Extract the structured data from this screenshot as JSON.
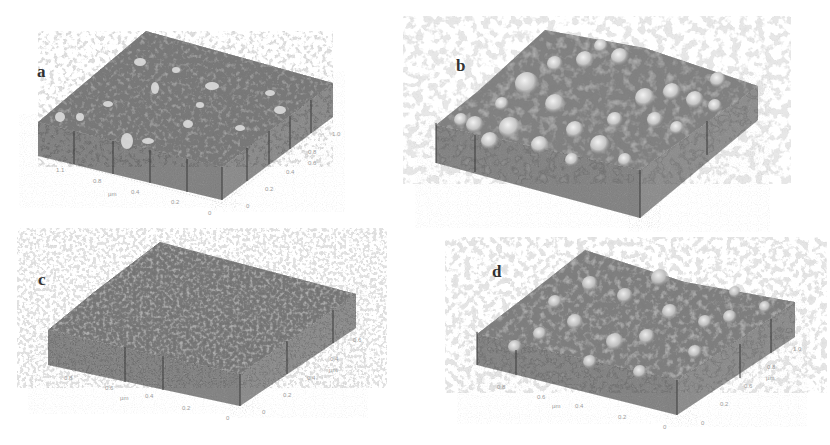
{
  "figure": {
    "colors": {
      "background": "#ffffff",
      "surface_base": "#8f8f8f",
      "surface_highlight": "#e6e6e6",
      "surface_shadow": "#5a5a5a",
      "wall": "#8c8c8c",
      "wall_line": "#3a3a3a",
      "label": "#333333",
      "tick": "#9a9a9a"
    },
    "panels": [
      {
        "label": "a",
        "texture": "fine, low roughness, small sparse grains",
        "ticks_left": [
          "1.1",
          "0.8",
          "µm",
          "0.4",
          "0.2",
          "0"
        ],
        "ticks_right": [
          "1.0",
          "0.8",
          "0.6",
          "0.4",
          "0.2",
          "0"
        ]
      },
      {
        "label": "b",
        "texture": "coarse, high roughness, large rounded grains",
        "ticks_left": [
          "",
          "",
          "",
          ""
        ],
        "ticks_right": [
          "",
          "",
          ""
        ]
      },
      {
        "label": "c",
        "texture": "dense, medium-small grains",
        "ticks_left": [
          "0.8",
          "0.6",
          "µm",
          "0.4",
          "0.2",
          "0"
        ],
        "ticks_right": [
          "0.6",
          "0.4",
          "µm",
          "0.4",
          "0.2",
          "0"
        ]
      },
      {
        "label": "d",
        "texture": "medium-large rounded grains",
        "ticks_left": [
          "0.8",
          "0.6",
          "µm",
          "0.4",
          "0.2",
          "0"
        ],
        "ticks_right": [
          "1.0",
          "0.8",
          "µm",
          "0.6",
          "0.2",
          "0"
        ]
      }
    ]
  }
}
